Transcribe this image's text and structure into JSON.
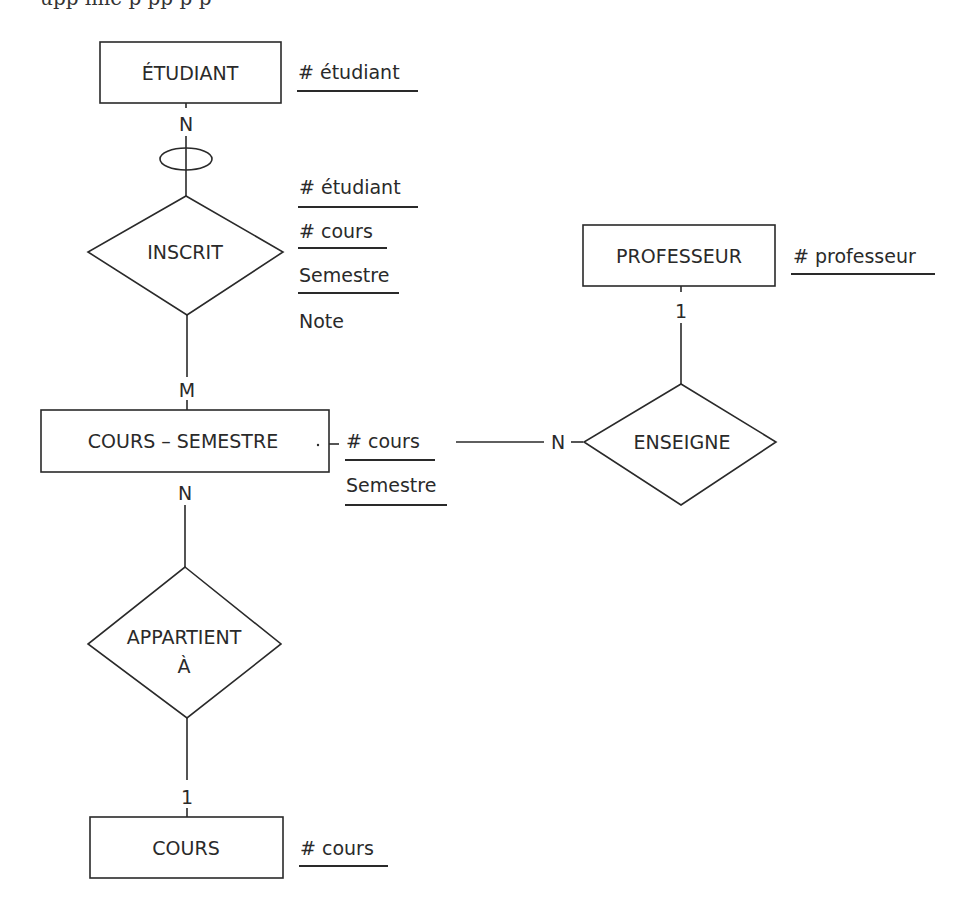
{
  "page": {
    "cutoff_text": "upp    ime    p      pp      p   p"
  },
  "diagram": {
    "type": "entity-relationship",
    "entities": [
      {
        "id": "etudiant",
        "label": "ÉTUDIANT",
        "attributes": [
          {
            "text": "# étudiant",
            "key": true
          }
        ]
      },
      {
        "id": "cours_semestre",
        "label": "COURS – SEMESTRE",
        "attributes": [
          {
            "text": "# cours",
            "key": true
          },
          {
            "text": "Semestre",
            "key": true
          }
        ]
      },
      {
        "id": "professeur",
        "label": "PROFESSEUR",
        "attributes": [
          {
            "text": "# professeur",
            "key": true
          }
        ]
      },
      {
        "id": "cours",
        "label": "COURS",
        "attributes": [
          {
            "text": "# cours",
            "key": true
          }
        ]
      }
    ],
    "relationships": [
      {
        "id": "inscrit",
        "label": "INSCRIT",
        "attributes": [
          {
            "text": "# étudiant",
            "key": true
          },
          {
            "text": "# cours",
            "key": true
          },
          {
            "text": "Semestre",
            "key": true
          },
          {
            "text": "Note",
            "key": false
          }
        ]
      },
      {
        "id": "enseigne",
        "label": "ENSEIGNE"
      },
      {
        "id": "appartient",
        "label_line1": "APPARTIENT",
        "label_line2": "À"
      }
    ],
    "cardinalities": {
      "etudiant_inscrit": "N",
      "inscrit_cours_semestre": "M",
      "cours_semestre_appartient": "N",
      "appartient_cours": "1",
      "professeur_enseigne": "1",
      "cours_semestre_enseigne": "N"
    }
  }
}
